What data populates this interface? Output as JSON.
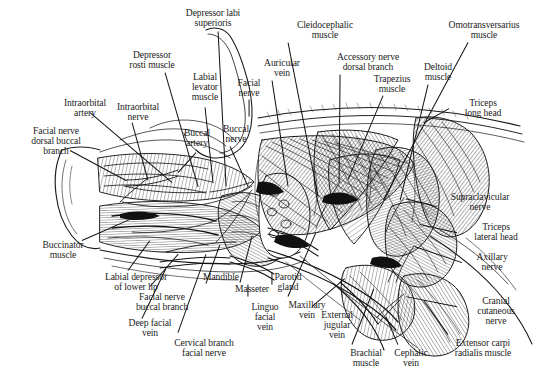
{
  "figure": {
    "kind": "anatomical-line-drawing",
    "width": 536,
    "height": 380,
    "background": "#ffffff",
    "ink_color": "#1a1a1a",
    "text_color": "#1c1c1c"
  },
  "labels": [
    {
      "id": "depressor-labi-superioris",
      "text": "Depressor labi\nsuperioris",
      "x": 168,
      "y": 8,
      "align": "c",
      "w": 90
    },
    {
      "id": "depressor-rosti-muscle",
      "text": "Depressor\nrosti muscle",
      "x": 112,
      "y": 50,
      "align": "c",
      "w": 80
    },
    {
      "id": "labial-levator-muscle",
      "text": "Labial\nlevator\nmuscle",
      "x": 181,
      "y": 72,
      "align": "c",
      "w": 48
    },
    {
      "id": "facial-nerve",
      "text": "Facial\nnerve",
      "x": 230,
      "y": 78,
      "align": "c",
      "w": 38
    },
    {
      "id": "auricular-vein",
      "text": "Auricular\nvein",
      "x": 255,
      "y": 58,
      "align": "c",
      "w": 54
    },
    {
      "id": "cleidocephalic-muscle",
      "text": "Cleidocephalic\nmuscle",
      "x": 283,
      "y": 20,
      "align": "c",
      "w": 84
    },
    {
      "id": "accessory-nerve-dorsal-branch",
      "text": "Accessory nerve\ndorsal branch",
      "x": 324,
      "y": 52,
      "align": "c",
      "w": 88
    },
    {
      "id": "trapezius-muscle",
      "text": "Trapezius\nmuscle",
      "x": 364,
      "y": 74,
      "align": "c",
      "w": 56
    },
    {
      "id": "deltoid-muscle",
      "text": "Deltoid\nmuscle",
      "x": 414,
      "y": 62,
      "align": "c",
      "w": 48
    },
    {
      "id": "omotransversarius-muscle",
      "text": "Omotransversarius\nmuscle",
      "x": 434,
      "y": 20,
      "align": "c",
      "w": 100
    },
    {
      "id": "triceps-long-head",
      "text": "Triceps\nlong head",
      "x": 455,
      "y": 98,
      "align": "c",
      "w": 56
    },
    {
      "id": "supraclavicular-nerve",
      "text": "Supraclavicular\nnerve",
      "x": 437,
      "y": 192,
      "align": "c",
      "w": 86
    },
    {
      "id": "triceps-lateral-head",
      "text": "Triceps\nlateral head",
      "x": 462,
      "y": 222,
      "align": "c",
      "w": 68
    },
    {
      "id": "axillary-nerve",
      "text": "Axillary\nnerve",
      "x": 466,
      "y": 252,
      "align": "c",
      "w": 52
    },
    {
      "id": "cranial-cutaneous-nerve",
      "text": "Cranial\ncutaneous\nnerve",
      "x": 466,
      "y": 296,
      "align": "c",
      "w": 60
    },
    {
      "id": "extensor-carpi-radialis-muscle",
      "text": "Extensor carpi\nradialis muscle",
      "x": 438,
      "y": 338,
      "align": "c",
      "w": 90
    },
    {
      "id": "cephalic-vein",
      "text": "Cephalic\nvein",
      "x": 385,
      "y": 348,
      "align": "c",
      "w": 52
    },
    {
      "id": "brachial-muscle",
      "text": "Brachial\nmuscle",
      "x": 340,
      "y": 348,
      "align": "c",
      "w": 52
    },
    {
      "id": "external-jugular-vein",
      "text": "External\njugular\nvein",
      "x": 311,
      "y": 310,
      "align": "c",
      "w": 52
    },
    {
      "id": "maxillary-vein",
      "text": "Maxillary\nvein",
      "x": 279,
      "y": 300,
      "align": "c",
      "w": 56
    },
    {
      "id": "linguo-facial-vein",
      "text": "Linguo\nfacial\nvein",
      "x": 243,
      "y": 302,
      "align": "c",
      "w": 44
    },
    {
      "id": "parotid-gland",
      "text": "Parotid\ngland",
      "x": 265,
      "y": 272,
      "align": "c",
      "w": 46
    },
    {
      "id": "masseter-muscle",
      "text": "Masseter",
      "x": 226,
      "y": 284,
      "align": "c",
      "w": 52
    },
    {
      "id": "mandible",
      "text": "Mandible",
      "x": 195,
      "y": 272,
      "align": "c",
      "w": 52
    },
    {
      "id": "cervical-branch-facial-nerve",
      "text": "Cervical branch\nfacial nerve",
      "x": 160,
      "y": 338,
      "align": "c",
      "w": 88
    },
    {
      "id": "deep-facial-vein",
      "text": "Deep facial\nvein",
      "x": 118,
      "y": 318,
      "align": "c",
      "w": 64
    },
    {
      "id": "facial-nerve-buccal-branch",
      "text": "Facial nerve\nbuccal branch",
      "x": 122,
      "y": 292,
      "align": "c",
      "w": 80
    },
    {
      "id": "labial-depressor-of-lower-lip",
      "text": "Labial depressor\nof lower lip",
      "x": 90,
      "y": 272,
      "align": "c",
      "w": 92
    },
    {
      "id": "buccinator-muscle",
      "text": "Buccinator\nmuscle",
      "x": 32,
      "y": 240,
      "align": "c",
      "w": 62
    },
    {
      "id": "facial-nerve-dorsal-buccal-branch",
      "text": "Facial nerve\ndorsal buccal\nbranch",
      "x": 15,
      "y": 126,
      "align": "c",
      "w": 82
    },
    {
      "id": "intraorbital-artery",
      "text": "Intraorbital\nartery",
      "x": 52,
      "y": 98,
      "align": "c",
      "w": 66
    },
    {
      "id": "intraorbital-nerve",
      "text": "Intraorbital\nnerve",
      "x": 105,
      "y": 102,
      "align": "c",
      "w": 66
    },
    {
      "id": "buccal-artery",
      "text": "Buccal\nartery",
      "x": 175,
      "y": 128,
      "align": "c",
      "w": 44
    },
    {
      "id": "buccal-nerve",
      "text": "Buccal\nnerve",
      "x": 214,
      "y": 124,
      "align": "c",
      "w": 44
    }
  ],
  "leaders": [
    {
      "id": "leader-depressor-labi-superioris",
      "x1": 218,
      "y1": 31,
      "x2": 226,
      "y2": 186
    },
    {
      "id": "leader-depressor-rosti-muscle",
      "x1": 165,
      "y1": 72,
      "x2": 198,
      "y2": 186
    },
    {
      "id": "leader-labial-levator-muscle",
      "x1": 205,
      "y1": 107,
      "x2": 213,
      "y2": 183
    },
    {
      "id": "leader-facial-nerve",
      "x1": 249,
      "y1": 99,
      "x2": 249,
      "y2": 116
    },
    {
      "id": "leader-auricular-vein",
      "x1": 272,
      "y1": 80,
      "x2": 288,
      "y2": 186
    },
    {
      "id": "leader-cleidocephalic-muscle",
      "x1": 288,
      "y1": 42,
      "x2": 318,
      "y2": 196
    },
    {
      "id": "leader-accessory-nerve-dorsal-branch",
      "x1": 340,
      "y1": 74,
      "x2": 339,
      "y2": 182
    },
    {
      "id": "leader-trapezius-muscle",
      "x1": 383,
      "y1": 95,
      "x2": 348,
      "y2": 179
    },
    {
      "id": "leader-deltoid-muscle",
      "x1": 428,
      "y1": 84,
      "x2": 400,
      "y2": 200
    },
    {
      "id": "leader-omotransversarius-muscle",
      "x1": 468,
      "y1": 42,
      "x2": 383,
      "y2": 200
    },
    {
      "id": "leader-triceps-long-head",
      "x1": 449,
      "y1": 108,
      "x2": 424,
      "y2": 122
    },
    {
      "id": "leader-supraclavicular-nerve",
      "x1": 437,
      "y1": 206,
      "x2": 406,
      "y2": 198
    },
    {
      "id": "leader-triceps-lateral-head",
      "x1": 457,
      "y1": 232,
      "x2": 420,
      "y2": 224
    },
    {
      "id": "leader-axillary-nerve",
      "x1": 462,
      "y1": 262,
      "x2": 415,
      "y2": 246
    },
    {
      "id": "leader-cranial-cutaneous-nerve",
      "x1": 457,
      "y1": 306,
      "x2": 406,
      "y2": 296
    },
    {
      "id": "leader-extensor-carpi-radialis-muscle",
      "x1": 448,
      "y1": 334,
      "x2": 424,
      "y2": 300
    },
    {
      "id": "leader-cephalic-vein",
      "x1": 398,
      "y1": 344,
      "x2": 386,
      "y2": 316
    },
    {
      "id": "leader-brachial-muscle",
      "x1": 352,
      "y1": 344,
      "x2": 374,
      "y2": 288
    },
    {
      "id": "leader-external-jugular-vein",
      "x1": 312,
      "y1": 306,
      "x2": 345,
      "y2": 278
    },
    {
      "id": "leader-maxillary-vein",
      "x1": 288,
      "y1": 296,
      "x2": 316,
      "y2": 232
    },
    {
      "id": "leader-linguo-facial-vein",
      "x1": 248,
      "y1": 296,
      "x2": 248,
      "y2": 284
    },
    {
      "id": "leader-parotid-gland",
      "x1": 272,
      "y1": 284,
      "x2": 272,
      "y2": 272
    },
    {
      "id": "leader-masseter-muscle",
      "x1": 240,
      "y1": 282,
      "x2": 252,
      "y2": 236
    },
    {
      "id": "leader-mandible",
      "x1": 206,
      "y1": 283,
      "x2": 220,
      "y2": 244
    },
    {
      "id": "leader-cervical-branch-facial-nerve",
      "x1": 178,
      "y1": 332,
      "x2": 206,
      "y2": 254
    },
    {
      "id": "leader-deep-facial-vein",
      "x1": 142,
      "y1": 318,
      "x2": 166,
      "y2": 268
    },
    {
      "id": "leader-facial-nerve-buccal-branch",
      "x1": 150,
      "y1": 286,
      "x2": 178,
      "y2": 254
    },
    {
      "id": "leader-labial-depressor-of-lower-lip",
      "x1": 128,
      "y1": 270,
      "x2": 150,
      "y2": 240
    },
    {
      "id": "leader-buccinator-muscle",
      "x1": 82,
      "y1": 240,
      "x2": 132,
      "y2": 218
    },
    {
      "id": "leader-facial-nerve-dorsal-buccal-branch",
      "x1": 70,
      "y1": 150,
      "x2": 126,
      "y2": 180
    },
    {
      "id": "leader-intraorbital-artery",
      "x1": 90,
      "y1": 112,
      "x2": 172,
      "y2": 182
    },
    {
      "id": "leader-intraorbital-nerve",
      "x1": 132,
      "y1": 122,
      "x2": 148,
      "y2": 180
    },
    {
      "id": "leader-buccal-artery",
      "x1": 196,
      "y1": 152,
      "x2": 178,
      "y2": 172
    },
    {
      "id": "leader-buccal-nerve",
      "x1": 230,
      "y1": 146,
      "x2": 248,
      "y2": 186
    }
  ]
}
